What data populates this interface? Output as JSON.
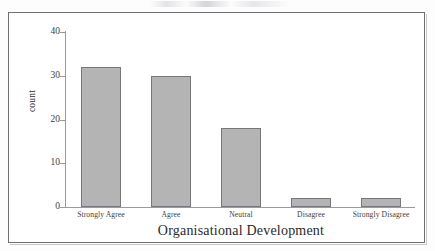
{
  "figure": {
    "background_color": "#fdfdfd",
    "frame_color": "#6f6f73",
    "bar_fill_color": "#b4b4b4",
    "bar_border_color": "#78787c",
    "axis_line_color": "#9a9a9e"
  },
  "chart_data": {
    "type": "bar",
    "title": "",
    "subtitle": "",
    "xlabel": "Organisational Development",
    "ylabel": "count",
    "categories": [
      "Strongly Agree",
      "Agree",
      "Neutral",
      "Disagree",
      "Strongly Disagree"
    ],
    "values": [
      32,
      30,
      18,
      2,
      2
    ],
    "ylim": [
      0,
      40
    ],
    "yticks": [
      0,
      10,
      20,
      30,
      40
    ],
    "ytick_labels": [
      "0",
      "10",
      "20",
      "30",
      "40"
    ],
    "grid": false,
    "legend": null,
    "legend_position": "none",
    "orientation": "vertical",
    "annotations": []
  }
}
